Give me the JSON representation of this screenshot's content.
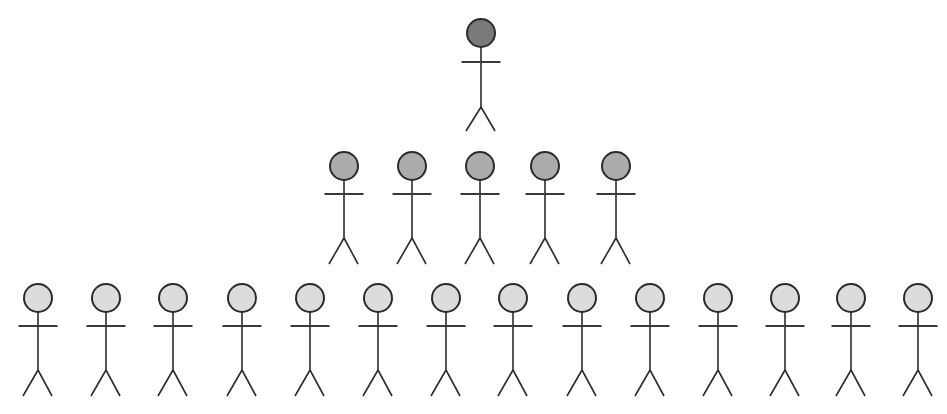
{
  "diagram": {
    "type": "hierarchy-of-stick-figures",
    "stroke_color": "#2b2b2b",
    "head_radius": 14,
    "levels": [
      {
        "name": "top",
        "count": 1,
        "head_fill": "#7a7a7a",
        "head_y": 33,
        "arm_y": 62,
        "hip_y": 107,
        "foot_y": 131,
        "xs": [
          481
        ]
      },
      {
        "name": "middle",
        "count": 5,
        "head_fill": "#ababab",
        "head_y": 166,
        "arm_y": 194,
        "hip_y": 238,
        "foot_y": 264,
        "xs": [
          344,
          412,
          480,
          545,
          616
        ]
      },
      {
        "name": "bottom",
        "count": 14,
        "head_fill": "#dcdcdc",
        "head_y": 298,
        "arm_y": 326,
        "hip_y": 370,
        "foot_y": 396,
        "xs": [
          38,
          106,
          173,
          242,
          310,
          378,
          446,
          513,
          582,
          650,
          718,
          785,
          851,
          918
        ]
      }
    ]
  }
}
